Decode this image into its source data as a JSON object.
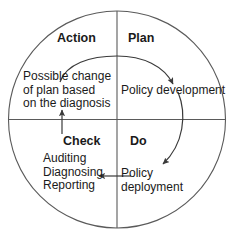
{
  "diagram": {
    "type": "pdca-cycle",
    "colors": {
      "stroke": "#4a4a4a",
      "text": "#1a1a1a",
      "background": "#ffffff"
    },
    "quadrants": [
      {
        "id": "action",
        "title": "Action",
        "position": "top-left",
        "body": "Possible change\nof plan based\non the diagnosis"
      },
      {
        "id": "plan",
        "title": "Plan",
        "position": "top-right",
        "body": "Policy development"
      },
      {
        "id": "check",
        "title": "Check",
        "position": "bottom-left",
        "body": "Auditing\nDiagnosing\nReporting"
      },
      {
        "id": "do",
        "title": "Do",
        "position": "bottom-right",
        "body": "Policy\ndeployment"
      }
    ],
    "arrows": [
      {
        "id": "plan-to-development",
        "from": "plan",
        "to": "policy-development",
        "shape": "curved-arc",
        "direction": "down-right"
      },
      {
        "id": "development-to-deployment",
        "from": "policy-development",
        "to": "policy-deployment",
        "shape": "curved-arc",
        "direction": "down-left"
      },
      {
        "id": "deployment-to-check",
        "from": "policy-deployment",
        "to": "check",
        "shape": "straight",
        "direction": "left"
      },
      {
        "id": "check-to-action",
        "from": "check",
        "to": "action",
        "shape": "straight",
        "direction": "up"
      }
    ]
  }
}
